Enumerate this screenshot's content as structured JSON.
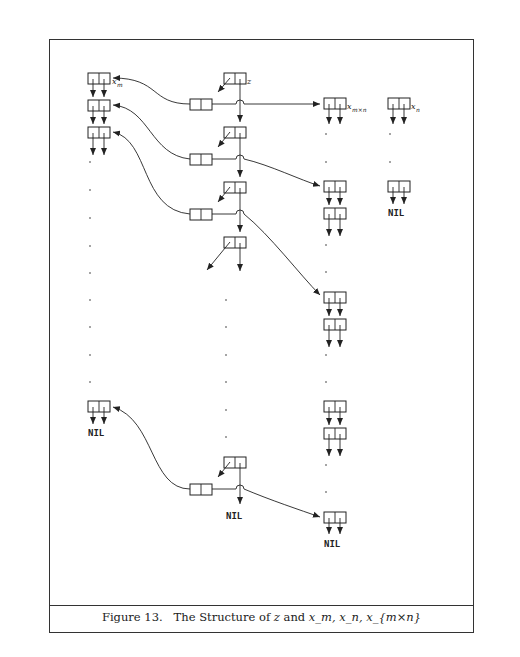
{
  "figure": {
    "number": "Figure 13.",
    "caption_text": "The Structure of",
    "caption_terms": [
      "z",
      "and",
      "x_m, x_n, x_{m×n}"
    ],
    "labels": {
      "z": "z",
      "xm": "x",
      "xm_sub": "m",
      "xn": "x",
      "xn_sub": "n",
      "xmn": "x",
      "xmn_sub": "m×n",
      "nil": "NIL"
    }
  },
  "decoration": {
    "stroke_color": "#222222",
    "background": "#ffffff"
  }
}
